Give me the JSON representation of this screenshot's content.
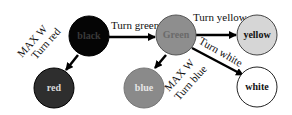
{
  "diagram": {
    "nodes": [
      {
        "id": "black",
        "label": "black",
        "fill": "#050505",
        "text": "#3a3a3a"
      },
      {
        "id": "red",
        "label": "red",
        "fill": "#2e2e2e",
        "text": "#d8d8d8"
      },
      {
        "id": "green",
        "label": "Green",
        "fill": "#8e8e8e",
        "text": "#6a6a6a"
      },
      {
        "id": "blue",
        "label": "blue",
        "fill": "#8a8a8a",
        "text": "#e6e6e6"
      },
      {
        "id": "yellow",
        "label": "yellow",
        "fill": "#d6d6d6",
        "text": "#111111"
      },
      {
        "id": "white",
        "label": "white",
        "fill": "#ffffff",
        "text": "#111111"
      }
    ],
    "edges": [
      {
        "from": "black",
        "to": "green",
        "label": "Turn green"
      },
      {
        "from": "black",
        "to": "red",
        "label_line1": "MAX W",
        "label_line2": "Turn red"
      },
      {
        "from": "green",
        "to": "yellow",
        "label": "Turn yellow"
      },
      {
        "from": "green",
        "to": "white",
        "label": "Turn white"
      },
      {
        "from": "green",
        "to": "blue",
        "label_line1": "MAX W",
        "label_line2": "Turn blue"
      }
    ]
  }
}
